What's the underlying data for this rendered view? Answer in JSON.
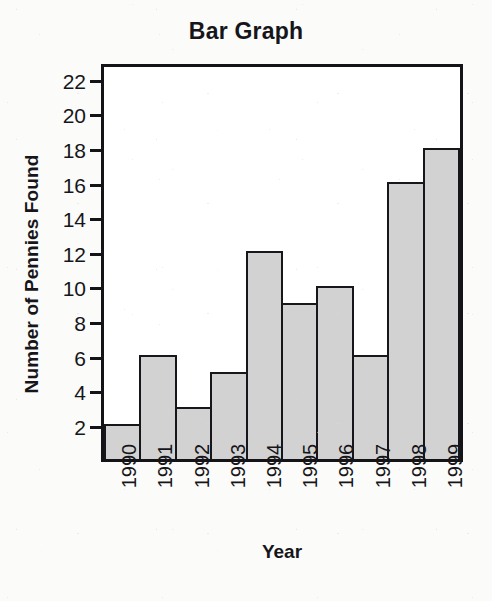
{
  "chart_data": {
    "type": "bar",
    "title": "Bar Graph",
    "xlabel": "Year",
    "ylabel": "Number of Pennies Found",
    "categories": [
      "1990",
      "1991",
      "1992",
      "1993",
      "1994",
      "1995",
      "1996",
      "1997",
      "1998",
      "1999"
    ],
    "values": [
      2,
      6,
      3,
      5,
      12,
      9,
      10,
      6,
      16,
      18
    ],
    "ylim": [
      0,
      23
    ],
    "yticks": [
      2,
      4,
      6,
      8,
      10,
      12,
      14,
      16,
      18,
      20,
      22
    ],
    "ytick_labels": [
      "2",
      "4",
      "6",
      "8",
      "10",
      "12",
      "14",
      "16",
      "18",
      "20",
      "22"
    ],
    "grid": false,
    "legend": null,
    "bar_fill_color": "#d2d2d2",
    "bar_edge_color": "#17171b",
    "axis_color": "#141418",
    "text_color": "#16161a",
    "plot_background": "#ffffff",
    "page_background": "#fbfbf9",
    "xtick_label_rotation": -90,
    "bars_contiguous": true
  }
}
